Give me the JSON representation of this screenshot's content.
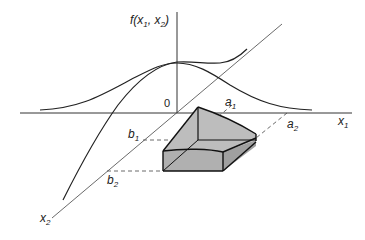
{
  "figure": {
    "type": "bivariate density surface with probability region",
    "labels": {
      "f_axis": "f(x",
      "f_axis_sub1": "1",
      "f_axis_mid": ", x",
      "f_axis_sub2": "2",
      "f_axis_close": ")",
      "origin": "0",
      "x1": "x",
      "x1_sub": "1",
      "x2": "x",
      "x2_sub": "2",
      "a1": "a",
      "a1_sub": "1",
      "a2": "a",
      "a2_sub": "2",
      "b1": "b",
      "b1_sub": "1",
      "b2": "b",
      "b2_sub": "2"
    },
    "colors": {
      "line": "#222222",
      "solid_fill": "#b8b8b8",
      "solid_top": "#c4c4c4"
    }
  }
}
